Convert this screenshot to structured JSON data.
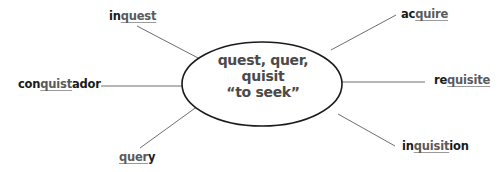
{
  "center": {
    "line1": "quest, quer,",
    "line2": "quisit",
    "line3": "“to seek”"
  },
  "words": {
    "inquest": {
      "prefix": "in",
      "root": "quest",
      "suffix": ""
    },
    "acquire": {
      "prefix": "ac",
      "root": "quire",
      "suffix": ""
    },
    "conquistador": {
      "prefix": "con",
      "root": "quist",
      "suffix": "ador"
    },
    "requisite": {
      "prefix": "re",
      "root": "quisite",
      "suffix": ""
    },
    "query": {
      "prefix": "",
      "root": "quer",
      "suffix": "y"
    },
    "inquisition": {
      "prefix": "in",
      "root": "quisit",
      "suffix": "ion"
    }
  },
  "colors": {
    "ellipse_stroke": "#1a1a1a",
    "line_stroke": "#6e6e6e",
    "root_text": "#5a5a5a",
    "word_text": "#1a1a1a"
  }
}
